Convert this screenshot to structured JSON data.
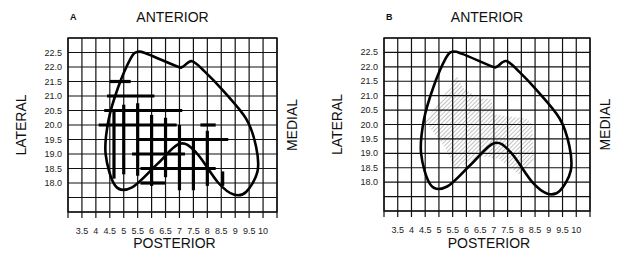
{
  "figure": {
    "panels": [
      {
        "id": "A",
        "label": "A",
        "top_label": "ANTERIOR",
        "bottom_label": "POSTERIOR",
        "left_label": "LATERAL",
        "right_label": "MEDIAL",
        "fill_style": "thick-grid-lines",
        "grid": {
          "x0": 68,
          "x1": 277,
          "y0": 38,
          "y1": 212,
          "cols": 15,
          "rows": 12
        },
        "label_x": 70,
        "label_y": 20
      },
      {
        "id": "B",
        "label": "B",
        "top_label": "ANTERIOR",
        "bottom_label": "POSTERIOR",
        "left_label": "LATERAL",
        "right_label": "MEDIAL",
        "fill_style": "hatched-region",
        "grid": {
          "x0": 384,
          "x1": 590,
          "y0": 38,
          "y1": 211,
          "cols": 15,
          "rows": 12
        },
        "label_x": 386,
        "label_y": 20
      }
    ],
    "x_ticks": [
      "3.5",
      "4",
      "4.5",
      "5",
      "5.5",
      "6",
      "6.5",
      "7",
      "7.5",
      "8",
      "8.5",
      "9",
      "9.5",
      "10"
    ],
    "y_ticks": [
      "22.5",
      "22.0",
      "21.5",
      "21.0",
      "20.5",
      "20.0",
      "19.5",
      "19.0",
      "18.5",
      "18.0"
    ]
  }
}
